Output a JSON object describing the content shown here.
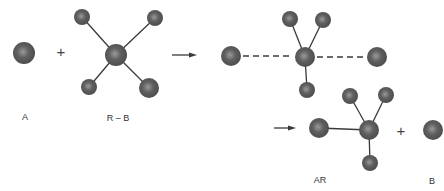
{
  "diagram": {
    "labels": {
      "reactant_a": "A",
      "reactant_rb": "R – B",
      "product_ar": "AR",
      "product_b": "B"
    },
    "operators": {
      "plus1": "+",
      "plus2": "+"
    },
    "colors": {
      "atom": "#555555",
      "atom_highlight": "#8a8a8a",
      "bond": "#3a3a3a"
    }
  }
}
